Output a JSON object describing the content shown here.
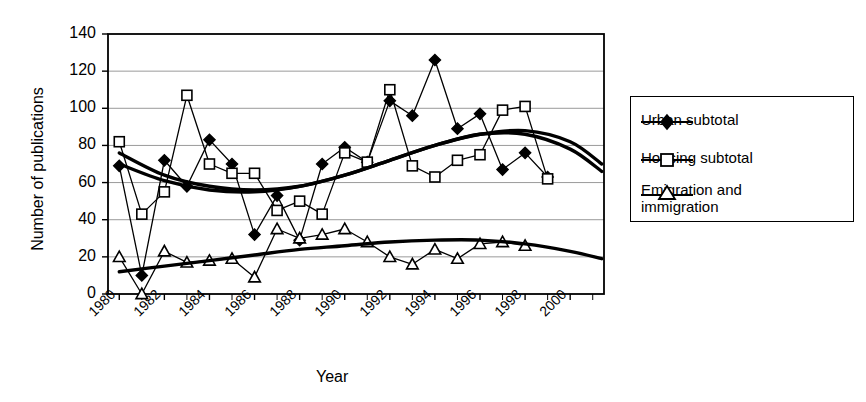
{
  "chart_data": {
    "type": "line",
    "title": "",
    "xlabel": "Year",
    "ylabel": "Number of publications",
    "xlim": [
      1979.5,
      2001.5
    ],
    "ylim": [
      0,
      140
    ],
    "ytick_labels": [
      "0",
      "20",
      "40",
      "60",
      "80",
      "100",
      "120",
      "140"
    ],
    "ytick_values": [
      0,
      20,
      40,
      60,
      80,
      100,
      120,
      140
    ],
    "xtick_labels": [
      "1980",
      "1982",
      "1984",
      "1986",
      "1988",
      "1990",
      "1992",
      "1994",
      "1996",
      "1998",
      "2000"
    ],
    "xtick_values": [
      1980,
      1982,
      1984,
      1986,
      1988,
      1990,
      1992,
      1994,
      1996,
      1998,
      2000
    ],
    "grid": true,
    "legend_position": "right-outside",
    "x": [
      1980,
      1981,
      1982,
      1983,
      1984,
      1985,
      1986,
      1987,
      1988,
      1989,
      1990,
      1991,
      1992,
      1993,
      1994,
      1995,
      1996,
      1997,
      1998,
      1999
    ],
    "series": [
      {
        "name": "Urban subtotal",
        "marker": "filled-diamond",
        "values": [
          69,
          10,
          72,
          58,
          83,
          70,
          32,
          53,
          29,
          70,
          79,
          71,
          104,
          96,
          126,
          89,
          97,
          67,
          76,
          63
        ],
        "trend": "polynomial"
      },
      {
        "name": "Housing subtotal",
        "marker": "open-square",
        "values": [
          82,
          43,
          55,
          107,
          70,
          65,
          65,
          45,
          50,
          43,
          76,
          71,
          110,
          69,
          63,
          72,
          75,
          99,
          101,
          62
        ],
        "trend": "polynomial"
      },
      {
        "name": "Emigration and immigration",
        "marker": "open-triangle",
        "values": [
          20,
          0,
          23,
          17,
          18,
          19,
          9,
          35,
          30,
          32,
          35,
          28,
          20,
          16,
          24,
          19,
          27,
          28,
          26,
          null
        ],
        "trend": "polynomial"
      }
    ],
    "trendlines": [
      {
        "for": "Urban subtotal",
        "points": [
          [
            1980,
            76
          ],
          [
            1982,
            64
          ],
          [
            1984,
            58
          ],
          [
            1986,
            56
          ],
          [
            1988,
            58
          ],
          [
            1990,
            64
          ],
          [
            1992,
            72
          ],
          [
            1994,
            80
          ],
          [
            1996,
            86
          ],
          [
            1998,
            86
          ],
          [
            2000,
            78
          ],
          [
            2001.4,
            66
          ]
        ]
      },
      {
        "for": "Housing subtotal",
        "points": [
          [
            1980,
            70
          ],
          [
            1982,
            61
          ],
          [
            1984,
            56
          ],
          [
            1986,
            55
          ],
          [
            1988,
            58
          ],
          [
            1990,
            64
          ],
          [
            1992,
            72
          ],
          [
            1994,
            80
          ],
          [
            1996,
            86
          ],
          [
            1998,
            88
          ],
          [
            2000,
            82
          ],
          [
            2001.4,
            70
          ]
        ]
      },
      {
        "for": "Emigration and immigration",
        "points": [
          [
            1980,
            12
          ],
          [
            1982,
            15
          ],
          [
            1984,
            18
          ],
          [
            1986,
            21
          ],
          [
            1988,
            24
          ],
          [
            1990,
            26
          ],
          [
            1992,
            28
          ],
          [
            1994,
            29
          ],
          [
            1996,
            29
          ],
          [
            1998,
            27
          ],
          [
            2000,
            23
          ],
          [
            2001.4,
            19
          ]
        ]
      }
    ]
  },
  "legend": {
    "items": [
      {
        "label": "Urban subtotal",
        "marker": "filled-diamond"
      },
      {
        "label": "Housing subtotal",
        "marker": "open-square"
      },
      {
        "label_line1": "Emigration and",
        "label_line2": "immigration",
        "marker": "open-triangle"
      }
    ]
  },
  "axis": {
    "y_title": "Number of publications",
    "x_title": "Year"
  },
  "colors": {
    "line": "#000000",
    "grid": "#9a9a9a",
    "frame": "#000000",
    "background": "#ffffff"
  }
}
